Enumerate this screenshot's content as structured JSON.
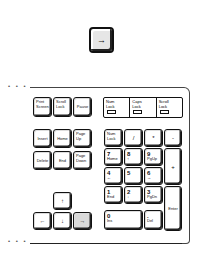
{
  "top_key": {
    "icon": "right-arrow-icon",
    "symbol": "→",
    "highlighted": true
  },
  "keyboard": {
    "system_keys": [
      {
        "label": "Print\nScreen"
      },
      {
        "label": "Scroll\nLock"
      },
      {
        "label": "Pause"
      }
    ],
    "indicators": [
      {
        "label": "Num\nLock"
      },
      {
        "label": "Caps\nLock"
      },
      {
        "label": "Scroll\nLock"
      }
    ],
    "nav_keys": [
      {
        "label": "Insert"
      },
      {
        "label": "Home"
      },
      {
        "label": "Page\nUp"
      },
      {
        "label": "Delete"
      },
      {
        "label": "End"
      },
      {
        "label": "Page\nDown"
      }
    ],
    "arrow_keys": {
      "up": "↑",
      "left": "←",
      "down": "↓",
      "right": "→",
      "highlighted": "right"
    },
    "numpad": {
      "num_lock": "Num\nLock",
      "divide": "/",
      "multiply": "*",
      "minus": "-",
      "k7": {
        "num": "7",
        "alt": "Home"
      },
      "k8": {
        "num": "8",
        "alt": "↑"
      },
      "k9": {
        "num": "9",
        "alt": "PgUp"
      },
      "plus": "+",
      "k4": {
        "num": "4",
        "alt": "←"
      },
      "k5": {
        "num": "5",
        "alt": ""
      },
      "k6": {
        "num": "6",
        "alt": "→"
      },
      "k1": {
        "num": "1",
        "alt": "End"
      },
      "k2": {
        "num": "2",
        "alt": "↓"
      },
      "k3": {
        "num": "3",
        "alt": "PgDn"
      },
      "enter": "Enter",
      "k0": {
        "num": "0",
        "alt": "Ins"
      },
      "dot": {
        "num": ".",
        "alt": "Del"
      }
    }
  }
}
